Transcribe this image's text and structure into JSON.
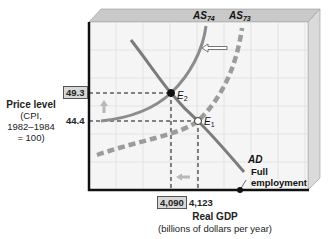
{
  "chart_data": {
    "type": "diagram",
    "title": "",
    "xlabel": "Real GDP",
    "xlabel_sub": "(billions of dollars per year)",
    "ylabel": "Price level",
    "ylabel_sub": [
      "(CPI,",
      "1982–1984",
      "= 100)"
    ],
    "x_ticks": [
      {
        "label": "4,090",
        "value": 4090,
        "highlighted": true
      },
      {
        "label": "4,123",
        "value": 4123,
        "highlighted": false
      }
    ],
    "y_ticks": [
      {
        "label": "49.3",
        "value": 49.3,
        "highlighted": true
      },
      {
        "label": "44.4",
        "value": 44.4,
        "highlighted": false
      }
    ],
    "curves": [
      {
        "name": "AD",
        "label": "AD",
        "style": "solid",
        "color": "#7a7a7a"
      },
      {
        "name": "AS74",
        "label": "AS",
        "subscript": "74",
        "style": "solid",
        "color": "#8a8a8a"
      },
      {
        "name": "AS73",
        "label": "AS",
        "subscript": "73",
        "style": "dashed",
        "color": "#9a9a9a"
      }
    ],
    "points": [
      {
        "name": "E2",
        "label": "E",
        "subscript": "2",
        "x": 4090,
        "y": 49.3,
        "fill": "#111111"
      },
      {
        "name": "E1",
        "label": "E",
        "subscript": "1",
        "x": 4123,
        "y": 44.4,
        "fill": "#ffffff"
      }
    ],
    "annotations": {
      "full_employment": [
        "Full",
        "employment"
      ],
      "shift_arrow": "AS shifts left",
      "price_arrow": "up",
      "gdp_arrow": "left"
    },
    "grid": true
  },
  "colors": {
    "panel_bg": "#f4f4f4",
    "grid": "#dcdcdc",
    "bevel_top": "#c8c8c8",
    "bevel_side": "#d8d8d8",
    "axis": "#111111",
    "arrow_fill": "#b8b8b8"
  }
}
